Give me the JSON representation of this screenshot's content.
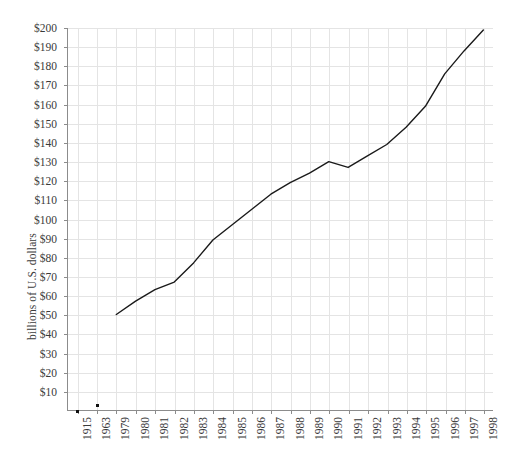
{
  "chart_data": {
    "type": "line",
    "title": "",
    "xlabel": "",
    "ylabel": "billions of U.S. dollars",
    "ylim": [
      0,
      200
    ],
    "ytick_labels": [
      "$200",
      "$190",
      "$180",
      "$170",
      "$160",
      "$150",
      "$140",
      "$130",
      "$120",
      "$110",
      "$100",
      "$90",
      "$80",
      "$70",
      "$60",
      "$50",
      "$40",
      "$30",
      "$20",
      "$10"
    ],
    "ytick_values": [
      200,
      190,
      180,
      170,
      160,
      150,
      140,
      130,
      120,
      110,
      100,
      90,
      80,
      70,
      60,
      50,
      40,
      30,
      20,
      10
    ],
    "categories": [
      "1915",
      "1963",
      "1979",
      "1980",
      "1981",
      "1982",
      "1983",
      "1984",
      "1985",
      "1986",
      "1987",
      "1988",
      "1989",
      "1990",
      "1991",
      "1992",
      "1993",
      "1994",
      "1995",
      "1996",
      "1997",
      "1998"
    ],
    "values": [
      0,
      3,
      50,
      57,
      63,
      67,
      77,
      89,
      97,
      105,
      113,
      119,
      124,
      130,
      127,
      133,
      139,
      148,
      159,
      176,
      188,
      199
    ],
    "marker_only_indices": [
      0,
      1
    ],
    "line_start_index": 2,
    "grid": true,
    "legend": "none",
    "line_color": "#1a1a1a",
    "grid_color": "#e4e4e4",
    "axis_color": "#8c8c8c",
    "text_color": "#3a3a3a",
    "background_color": "#ffffff"
  }
}
